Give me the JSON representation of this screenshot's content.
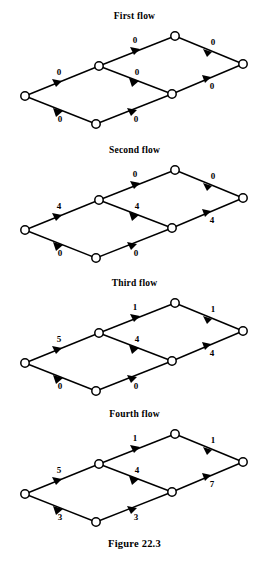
{
  "figure": {
    "caption": "Figure 22.3",
    "cut_off_header": "",
    "node_count_per_graph": 7,
    "edge_count_per_graph": 8
  },
  "flows": [
    {
      "title": "First flow",
      "labels": {
        "source_to_upper": "0",
        "source_to_lower": "0",
        "upper_to_top": "0",
        "upper_to_mid": "0",
        "lower_to_mid": "0",
        "top_to_sink": "0",
        "mid_to_sink": "0"
      }
    },
    {
      "title": "Second flow",
      "labels": {
        "source_to_upper": "4",
        "source_to_lower": "0",
        "upper_to_top": "0",
        "upper_to_mid": "4",
        "lower_to_mid": "0",
        "top_to_sink": "0",
        "mid_to_sink": "4"
      }
    },
    {
      "title": "Third flow",
      "labels": {
        "source_to_upper": "5",
        "source_to_lower": "0",
        "upper_to_top": "1",
        "upper_to_mid": "4",
        "lower_to_mid": "0",
        "top_to_sink": "1",
        "mid_to_sink": "4"
      }
    },
    {
      "title": "Fourth flow",
      "labels": {
        "source_to_upper": "5",
        "source_to_lower": "3",
        "upper_to_top": "1",
        "upper_to_mid": "4",
        "lower_to_mid": "3",
        "top_to_sink": "1",
        "mid_to_sink": "7"
      }
    }
  ]
}
